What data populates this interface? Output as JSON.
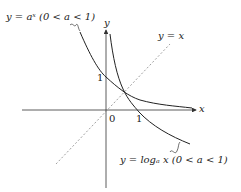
{
  "diagram": {
    "labels": {
      "exp_curve": "y = aˣ (0 < a < 1)",
      "log_curve": "y = logₐ x (0 < a < 1)",
      "identity_line": "y = x",
      "x_axis": "x",
      "y_axis": "y",
      "origin": "0",
      "x_tick_1": "1",
      "y_tick_1": "1"
    },
    "colors": {
      "curve": "#222222",
      "axis": "#333333",
      "dashed": "#777777"
    }
  }
}
